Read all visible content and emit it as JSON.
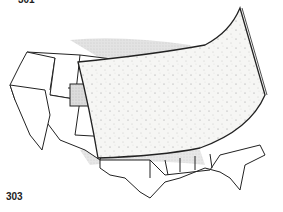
{
  "figure": {
    "label_top": "301",
    "label_bottom": "303",
    "colors": {
      "line": "#222222",
      "shadow": "#cfcfcf",
      "panel": "#f4f4f2",
      "background": "#ffffff"
    }
  }
}
